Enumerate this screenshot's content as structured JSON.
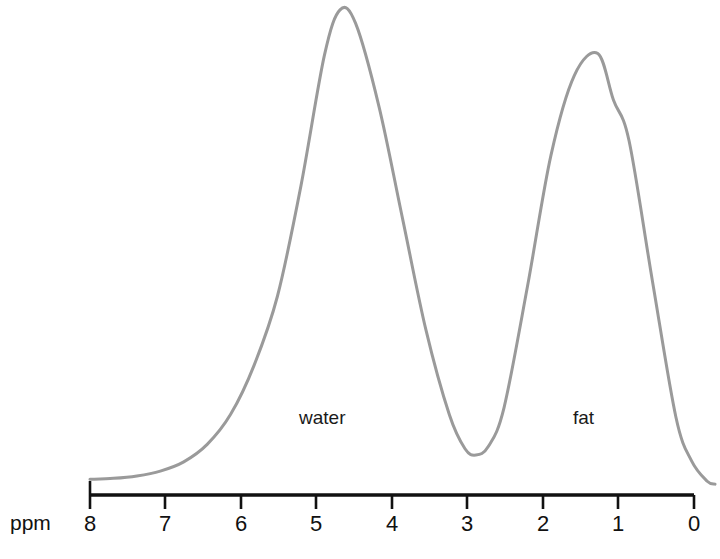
{
  "figure": {
    "name": "proton-mr-spectrum",
    "background_color": "#ffffff"
  },
  "axis": {
    "unit_label": "ppm",
    "orientation": "horizontal-reversed",
    "line_color": "#111111",
    "tick_labels": [
      "8",
      "7",
      "6",
      "5",
      "4",
      "3",
      "2",
      "1",
      "0"
    ]
  },
  "annotations": {
    "water_label": "water",
    "fat_label": "fat"
  },
  "chart_data": {
    "type": "line",
    "title": "",
    "subtitle": "",
    "xlabel": "ppm",
    "ylabel": "",
    "xlim": [
      8,
      0
    ],
    "ylim": [
      0,
      1
    ],
    "grid": false,
    "legend": "none",
    "curve_color": "#9a9a9a",
    "curve_width_px": 3,
    "x_tick_values": [
      8,
      7,
      6,
      5,
      4,
      3,
      2,
      1,
      0
    ],
    "x_tick_labels": [
      "8",
      "7",
      "6",
      "5",
      "4",
      "3",
      "2",
      "1",
      "0"
    ],
    "series": [
      {
        "name": "spectrum",
        "color": "#9a9a9a",
        "x": [
          8.0,
          7.7,
          7.4,
          7.1,
          6.8,
          6.5,
          6.2,
          5.9,
          5.6,
          5.3,
          5.0,
          4.8,
          4.6,
          4.3,
          4.0,
          3.7,
          3.4,
          3.2,
          3.06,
          2.9,
          2.7,
          2.4,
          2.1,
          1.8,
          1.5,
          1.3,
          1.1,
          0.8,
          0.5,
          0.3,
          0.1,
          0.0
        ],
        "y": [
          0.022,
          0.024,
          0.029,
          0.039,
          0.058,
          0.094,
          0.156,
          0.257,
          0.4,
          0.627,
          0.896,
          0.99,
          0.962,
          0.79,
          0.56,
          0.33,
          0.155,
          0.085,
          0.072,
          0.09,
          0.17,
          0.42,
          0.69,
          0.855,
          0.9,
          0.804,
          0.72,
          0.43,
          0.15,
          0.06,
          0.018,
          0.012
        ]
      }
    ],
    "annotations": [
      {
        "text": "water",
        "x_ppm": 4.8,
        "peak_height": 1.0,
        "label_x_ppm": 4.6,
        "label_y": 0.11
      },
      {
        "text": "fat",
        "x_ppm": 1.3,
        "peak_height": 0.8,
        "label_x_ppm": 1.0,
        "label_y": 0.11
      }
    ],
    "peaks": [
      {
        "name": "water",
        "ppm": 4.8,
        "relative_amplitude": 1.0
      },
      {
        "name": "fat",
        "ppm": 1.3,
        "relative_amplitude": 0.8
      }
    ],
    "valley": {
      "ppm": 3.06,
      "relative_amplitude": 0.072
    }
  }
}
